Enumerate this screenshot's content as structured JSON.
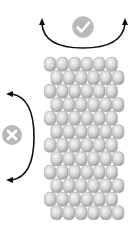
{
  "diagram": {
    "title": "",
    "colors": {
      "background": "#ffffff",
      "bead_light": "#f2f2f2",
      "bead_mid": "#cfcfcf",
      "bead_dark": "#9a9a9a",
      "bead_outline": "#a8a8a8",
      "arrow": "#111111",
      "icon_circle": "#b5b5b5",
      "icon_glyph": "#ffffff"
    },
    "bead_grid": {
      "rows": 12,
      "beads_per_row": 6,
      "origin_x": 44,
      "origin_y": 57,
      "bead_width": 12.3,
      "bead_height": 13.5,
      "offset_x": 6.5,
      "offset_rows": "odd"
    },
    "indicators": [
      {
        "name": "horizontal-rotation",
        "icon": "check-icon",
        "status": "allowed",
        "arrow": "horizontal-arc"
      },
      {
        "name": "vertical-rotation",
        "icon": "cross-icon",
        "status": "not-allowed",
        "arrow": "vertical-arc"
      }
    ]
  }
}
